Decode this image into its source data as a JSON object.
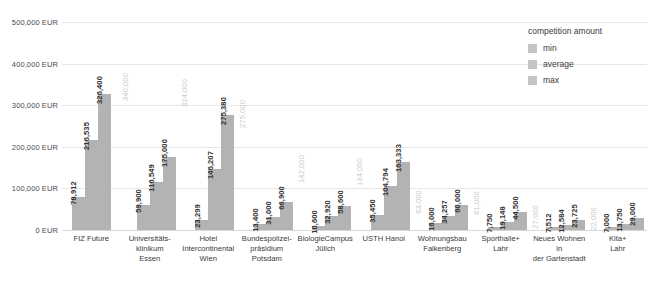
{
  "chart_data": {
    "type": "bar",
    "title": "",
    "xlabel": "",
    "ylabel": "",
    "ylim": [
      0,
      500000
    ],
    "grid": true,
    "legend_position": "top-right",
    "legend_title": "competition amount",
    "currency_suffix": "EUR",
    "y_ticks": [
      {
        "value": 500000,
        "label": "500,000 EUR"
      },
      {
        "value": 400000,
        "label": "400,000 EUR"
      },
      {
        "value": 300000,
        "label": "300,000 EUR"
      },
      {
        "value": 200000,
        "label": "200,000 EUR"
      },
      {
        "value": 100000,
        "label": "100,000 EUR"
      },
      {
        "value": 0,
        "label": "0 EUR"
      }
    ],
    "categories": [
      "FIZ Future",
      "Universitäts-\nklinikum\nEssen",
      "Hotel\nIntercontinental\nWien",
      "Bundespolizei-\npräsidium\nPotsdam",
      "BiologieCampus\nJülich",
      "USTH Hanoi",
      "Wohnungsbau\nFalkenberg",
      "Sporthalle+\nLahr",
      "Neues Wohnen in\nder Gartenstadt",
      "Kita+\nLahr"
    ],
    "series": [
      {
        "name": "min",
        "color": "#b3b3b3",
        "values": [
          78912,
          59900,
          23299,
          13400,
          10600,
          35450,
          16000,
          7750,
          7512,
          7000
        ],
        "labels": [
          "78,912",
          "59,900",
          "23,299",
          "13,400",
          "10,600",
          "35,450",
          "16,000",
          "7,750",
          "7,512",
          "7,000"
        ]
      },
      {
        "name": "average",
        "color": "#b3b3b3",
        "values": [
          216535,
          116549,
          146207,
          31000,
          32920,
          104794,
          34257,
          19148,
          12584,
          13750
        ],
        "labels": [
          "216,535",
          "116,549",
          "146,207",
          "31,000",
          "32,920",
          "104,794",
          "34,257",
          "19,148",
          "12,584",
          "13,750"
        ]
      },
      {
        "name": "max",
        "color": "#b3b3b3",
        "values": [
          326400,
          175000,
          275380,
          66900,
          58600,
          163333,
          60000,
          44500,
          23725,
          29000
        ],
        "labels": [
          "326,400",
          "175,000",
          "275,380",
          "66,900",
          "58,600",
          "163,333",
          "60,000",
          "44,500",
          "23,725",
          "29,000"
        ]
      }
    ],
    "ghost_annotations": [
      {
        "category_index": 1,
        "value": 340000,
        "label": "340,000"
      },
      {
        "category_index": 2,
        "value": 324000,
        "label": "324,000"
      },
      {
        "category_index": 3,
        "value": 275000,
        "label": "275,000"
      },
      {
        "category_index": 4,
        "value": 142000,
        "label": "142,000"
      },
      {
        "category_index": 5,
        "value": 134000,
        "label": "134,000"
      },
      {
        "category_index": 6,
        "value": 63000,
        "label": "63,000"
      },
      {
        "category_index": 7,
        "value": 61000,
        "label": "61,000"
      },
      {
        "category_index": 8,
        "value": 27000,
        "label": "27,000"
      },
      {
        "category_index": 9,
        "value": 22000,
        "label": "22,000"
      }
    ]
  },
  "legend": {
    "title": "competition amount",
    "items": [
      {
        "label": "min",
        "color": "#c4c4c4"
      },
      {
        "label": "average",
        "color": "#c4c4c4"
      },
      {
        "label": "max",
        "color": "#c4c4c4"
      }
    ]
  }
}
